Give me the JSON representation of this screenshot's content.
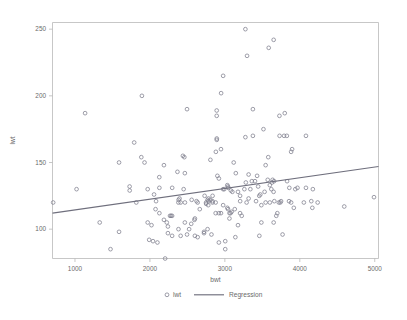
{
  "chart_data": {
    "type": "scatter",
    "title": "",
    "xlabel": "bwt",
    "ylabel": "lwt",
    "xlim": [
      700,
      5050
    ],
    "ylim": [
      78,
      255
    ],
    "xticks": [
      1000,
      2000,
      3000,
      4000,
      5000
    ],
    "yticks": [
      100,
      150,
      200,
      250
    ],
    "xtick_labels": [
      "1000",
      "2000",
      "3000",
      "4000",
      "5000"
    ],
    "ytick_labels": [
      "100",
      "150",
      "200",
      "250"
    ],
    "grid": false,
    "legend_position": "bottom-center",
    "legend": [
      {
        "label": "lwt",
        "marker": "open-circle",
        "color": "#7d7d8c"
      },
      {
        "label": "Regression",
        "marker": "line",
        "color": "#6f6f7d"
      }
    ],
    "series": [
      {
        "name": "lwt",
        "marker": "open-circle",
        "color": "#7d7d8c",
        "points": [
          [
            709,
            120
          ],
          [
            1021,
            130
          ],
          [
            1135,
            187
          ],
          [
            1330,
            105
          ],
          [
            1474,
            85
          ],
          [
            1588,
            98
          ],
          [
            1588,
            150
          ],
          [
            1729,
            132
          ],
          [
            1730,
            129
          ],
          [
            1790,
            165
          ],
          [
            1818,
            120
          ],
          [
            1885,
            154
          ],
          [
            1893,
            200
          ],
          [
            1928,
            150
          ],
          [
            1970,
            105
          ],
          [
            1970,
            130
          ],
          [
            1990,
            92
          ],
          [
            2021,
            103
          ],
          [
            2041,
            91
          ],
          [
            2055,
            126
          ],
          [
            2075,
            115
          ],
          [
            2082,
            121
          ],
          [
            2100,
            90
          ],
          [
            2125,
            139
          ],
          [
            2126,
            131
          ],
          [
            2126,
            112
          ],
          [
            2187,
            148
          ],
          [
            2187,
            107
          ],
          [
            2203,
            78
          ],
          [
            2225,
            105
          ],
          [
            2240,
            102
          ],
          [
            2240,
            97
          ],
          [
            2268,
            110
          ],
          [
            2282,
            110
          ],
          [
            2296,
            110
          ],
          [
            2296,
            95
          ],
          [
            2297,
            131
          ],
          [
            2367,
            143
          ],
          [
            2380,
            120
          ],
          [
            2381,
            100
          ],
          [
            2383,
            122
          ],
          [
            2395,
            123
          ],
          [
            2410,
            95
          ],
          [
            2410,
            120
          ],
          [
            2440,
            155
          ],
          [
            2450,
            130
          ],
          [
            2459,
            154
          ],
          [
            2466,
            142
          ],
          [
            2466,
            105
          ],
          [
            2467,
            120
          ],
          [
            2495,
            190
          ],
          [
            2495,
            96
          ],
          [
            2523,
            100
          ],
          [
            2551,
            104
          ],
          [
            2557,
            122
          ],
          [
            2594,
            107
          ],
          [
            2600,
            108
          ],
          [
            2600,
            95
          ],
          [
            2622,
            121
          ],
          [
            2637,
            94
          ],
          [
            2637,
            120
          ],
          [
            2665,
            115
          ],
          [
            2722,
            97
          ],
          [
            2722,
            98
          ],
          [
            2730,
            125
          ],
          [
            2750,
            119
          ],
          [
            2750,
            120
          ],
          [
            2769,
            122
          ],
          [
            2769,
            100
          ],
          [
            2778,
            118
          ],
          [
            2782,
            123
          ],
          [
            2782,
            121
          ],
          [
            2807,
            152
          ],
          [
            2807,
            122
          ],
          [
            2821,
            96
          ],
          [
            2835,
            121
          ],
          [
            2835,
            120
          ],
          [
            2836,
            125
          ],
          [
            2877,
            120
          ],
          [
            2877,
            112
          ],
          [
            2880,
            158
          ],
          [
            2891,
            189
          ],
          [
            2891,
            185
          ],
          [
            2892,
            168
          ],
          [
            2892,
            167
          ],
          [
            2900,
            140
          ],
          [
            2920,
            138
          ],
          [
            2920,
            112
          ],
          [
            2920,
            90
          ],
          [
            2948,
            160
          ],
          [
            2948,
            112
          ],
          [
            2950,
            202
          ],
          [
            2977,
            215
          ],
          [
            2977,
            130
          ],
          [
            2977,
            118
          ],
          [
            2992,
            130
          ],
          [
            3005,
            85
          ],
          [
            3005,
            91
          ],
          [
            3033,
            133
          ],
          [
            3033,
            116
          ],
          [
            3040,
            132
          ],
          [
            3042,
            115
          ],
          [
            3047,
            131
          ],
          [
            3061,
            108
          ],
          [
            3062,
            112
          ],
          [
            3076,
            112
          ],
          [
            3080,
            129
          ],
          [
            3090,
            113
          ],
          [
            3100,
            128
          ],
          [
            3118,
            150
          ],
          [
            3132,
            115
          ],
          [
            3140,
            94
          ],
          [
            3146,
            142
          ],
          [
            3175,
            103
          ],
          [
            3175,
            128
          ],
          [
            3203,
            125
          ],
          [
            3203,
            112
          ],
          [
            3204,
            121
          ],
          [
            3225,
            110
          ],
          [
            3260,
            130
          ],
          [
            3274,
            250
          ],
          [
            3274,
            169
          ],
          [
            3280,
            135
          ],
          [
            3290,
            120
          ],
          [
            3296,
            230
          ],
          [
            3317,
            123
          ],
          [
            3317,
            141
          ],
          [
            3340,
            130
          ],
          [
            3360,
            136
          ],
          [
            3374,
            170
          ],
          [
            3374,
            190
          ],
          [
            3402,
            136
          ],
          [
            3416,
            121
          ],
          [
            3430,
            140
          ],
          [
            3444,
            132
          ],
          [
            3459,
            125
          ],
          [
            3460,
            95
          ],
          [
            3473,
            126
          ],
          [
            3487,
            118
          ],
          [
            3487,
            105
          ],
          [
            3515,
            175
          ],
          [
            3530,
            128
          ],
          [
            3544,
            148
          ],
          [
            3544,
            120
          ],
          [
            3572,
            137
          ],
          [
            3579,
            154
          ],
          [
            3585,
            236
          ],
          [
            3600,
            133
          ],
          [
            3600,
            120
          ],
          [
            3620,
            130
          ],
          [
            3629,
            135
          ],
          [
            3637,
            137
          ],
          [
            3650,
            128
          ],
          [
            3651,
            105
          ],
          [
            3651,
            242
          ],
          [
            3657,
            136
          ],
          [
            3660,
            121
          ],
          [
            3686,
            110
          ],
          [
            3700,
            112
          ],
          [
            3720,
            120
          ],
          [
            3728,
            185
          ],
          [
            3730,
            170
          ],
          [
            3740,
            120
          ],
          [
            3750,
            121
          ],
          [
            3770,
            96
          ],
          [
            3790,
            170
          ],
          [
            3799,
            187
          ],
          [
            3827,
            170
          ],
          [
            3830,
            136
          ],
          [
            3856,
            121
          ],
          [
            3860,
            131
          ],
          [
            3884,
            158
          ],
          [
            3884,
            120
          ],
          [
            3897,
            160
          ],
          [
            3920,
            116
          ],
          [
            3940,
            130
          ],
          [
            3969,
            131
          ],
          [
            4054,
            120
          ],
          [
            4082,
            170
          ],
          [
            4082,
            131
          ],
          [
            4153,
            121
          ],
          [
            4167,
            116
          ],
          [
            4174,
            130
          ],
          [
            4238,
            120
          ],
          [
            4593,
            117
          ],
          [
            4990,
            124
          ]
        ]
      }
    ],
    "regression": {
      "name": "Regression",
      "color": "#6f6f7d",
      "x_start": 700,
      "x_end": 5050,
      "y_start": 112.0,
      "y_end": 147.0
    }
  }
}
